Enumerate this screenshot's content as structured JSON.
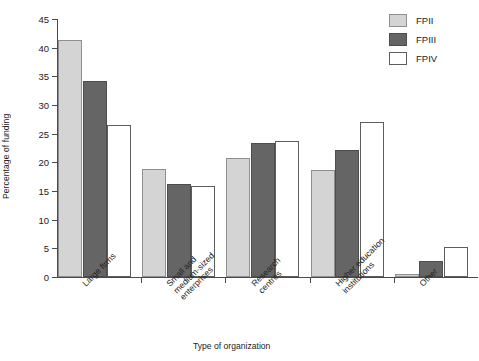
{
  "chart_data": {
    "type": "bar",
    "title": "",
    "xlabel": "Type of organization",
    "ylabel": "Percentage of funding",
    "categories": [
      "Large firms",
      "Small and\nmedium-sized\nenterprises",
      "Research\ncentres",
      "Higher education\ninstitutions",
      "Other"
    ],
    "series": [
      {
        "name": "FPII",
        "color": "#d4d4d4",
        "values": [
          41.3,
          18.8,
          20.8,
          18.6,
          0.5
        ]
      },
      {
        "name": "FPIII",
        "color": "#656565",
        "values": [
          34.2,
          16.2,
          23.3,
          22.2,
          2.8
        ]
      },
      {
        "name": "FPIV",
        "color": "#ffffff",
        "values": [
          26.6,
          15.8,
          23.8,
          27.0,
          5.3
        ]
      }
    ],
    "ylim": [
      0,
      45
    ],
    "yticks": [
      0,
      5,
      10,
      15,
      20,
      25,
      30,
      35,
      40,
      45
    ],
    "grid": false,
    "legend_position": "top-right",
    "legend": [
      "FPII",
      "FPIII",
      "FPIV"
    ]
  }
}
